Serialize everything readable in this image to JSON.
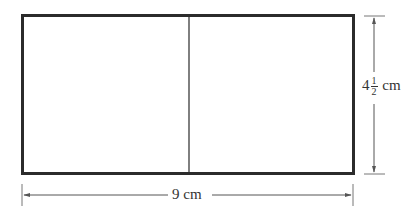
{
  "diagram": {
    "shape": "rectangle divided into two parts by a vertical line",
    "width_label": "9 cm",
    "height_label": {
      "whole": "4",
      "numerator": "1",
      "denominator": "2",
      "unit": "cm"
    },
    "colors": {
      "stroke": "#2b2b2b",
      "dimension_line": "#555555",
      "background": "#ffffff"
    }
  }
}
